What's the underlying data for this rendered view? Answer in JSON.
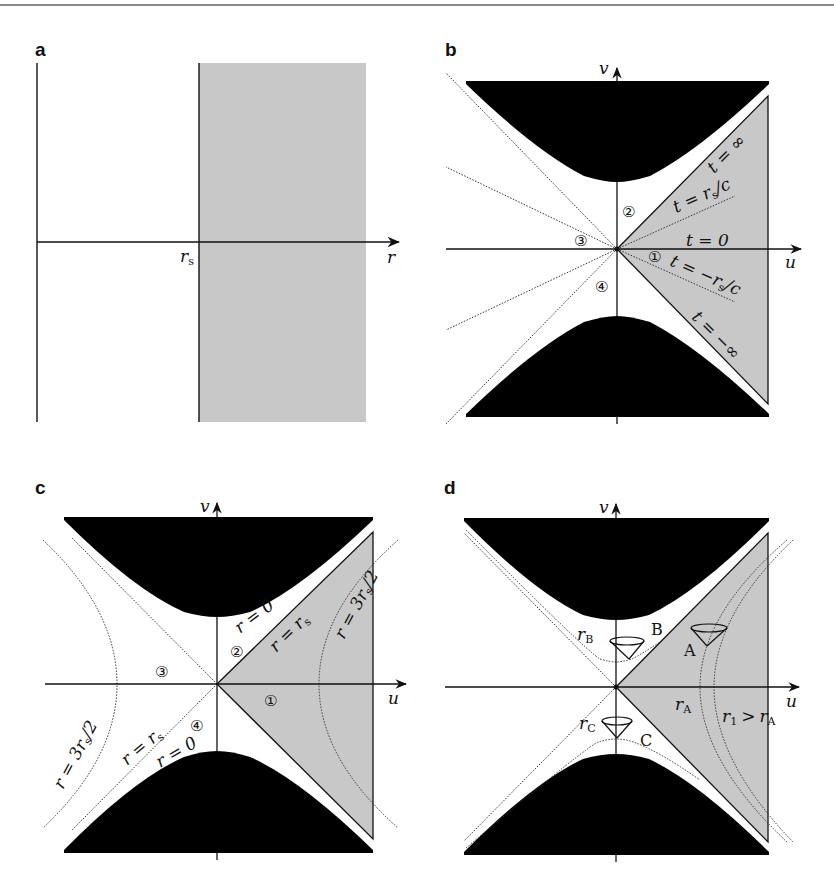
{
  "figure": {
    "panels": [
      {
        "id": "a",
        "label": "a",
        "axis_label": "r",
        "marker_label": "r",
        "marker_sub": "s"
      },
      {
        "id": "b",
        "label": "b",
        "v_axis": "v",
        "u_axis": "u",
        "regions": [
          "①",
          "②",
          "③",
          "④"
        ],
        "lines": {
          "t_inf": "t = ∞",
          "t_rs": "t = r",
          "t_rs_sub": "s",
          "t_rs_tail": "/c",
          "t_zero": "t = 0",
          "t_mrs": "t = −r",
          "t_mrs_sub": "s",
          "t_mrs_tail": "/c",
          "t_minf": "t = −∞"
        }
      },
      {
        "id": "c",
        "label": "c",
        "v_axis": "v",
        "u_axis": "u",
        "regions": [
          "①",
          "②",
          "③",
          "④"
        ],
        "lines": {
          "r0_top": "r = 0",
          "rrs_top": "r = r",
          "rrs_sub": "s",
          "r3_right": "r = 3r",
          "r3_sub": "s",
          "r3_tail": "/2",
          "r3_left": "r = 3r",
          "rrs_bottom": "r = r",
          "r0_bottom": "r = 0"
        }
      },
      {
        "id": "d",
        "label": "d",
        "v_axis": "v",
        "u_axis": "u",
        "points": [
          "A",
          "B",
          "C"
        ],
        "radii": {
          "rB": "r",
          "rB_sub": "B",
          "rC": "r",
          "rC_sub": "C",
          "rA": "r",
          "rA_sub": "A",
          "r1": "r",
          "r1_sub": "1",
          "gt": ">",
          "r1_rhs": "r",
          "r1_rhs_sub": "A"
        }
      }
    ],
    "colors": {
      "singularity": "#000000",
      "exterior_shade": "#c8c8c8",
      "axis": "#111111",
      "dotted": "#333333",
      "border": "#8a8a8a"
    }
  }
}
